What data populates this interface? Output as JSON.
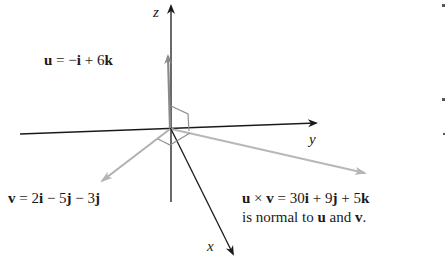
{
  "figure": {
    "axes": {
      "x": "x",
      "y": "y",
      "z": "z"
    },
    "vectors": {
      "u": {
        "name": "u",
        "equals": " = −",
        "i": "i",
        "plus": " + 6",
        "k": "k"
      },
      "v": {
        "name": "v",
        "equals": " = 2",
        "i": "i",
        "minus1": " − 5",
        "j1": "j",
        "minus2": " − 3",
        "j2": "j"
      },
      "cross": {
        "u": "u",
        "times": " × ",
        "v": "v",
        "equals": " = 30",
        "i": "i",
        "plus1": " + 9",
        "j": "j",
        "plus2": " + 5",
        "k": "k",
        "line2_prefix": "is normal to ",
        "line2_u": "u",
        "line2_and": " and ",
        "line2_v": "v",
        "line2_end": "."
      }
    },
    "colors": {
      "axis": "#1a1a1a",
      "vector_u": "#8a8a8a",
      "vector_v": "#b0b0b0",
      "vector_cross": "#b8b8b8",
      "right_angle": "#909090"
    }
  }
}
